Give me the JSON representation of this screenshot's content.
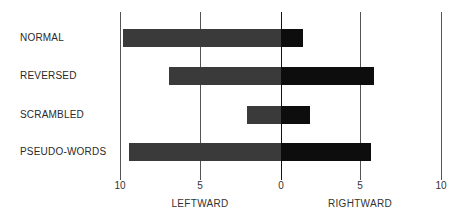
{
  "chart_data": {
    "type": "bar",
    "orientation": "horizontal-diverging",
    "title": "",
    "categories": [
      "NORMAL",
      "REVERSED",
      "SCRAMBLED",
      "PSEUDO-WORDS"
    ],
    "series": [
      {
        "name": "LEFTWARD",
        "values": [
          9.9,
          7.0,
          2.1,
          9.5
        ],
        "color": "#3a3a3a"
      },
      {
        "name": "RIGHTWARD",
        "values": [
          1.4,
          5.8,
          1.8,
          5.6
        ],
        "color": "#0d0d0d"
      }
    ],
    "xlabel_left": "LEFTWARD",
    "xlabel_right": "RIGHTWARD",
    "xticks": [
      "10",
      "5",
      "0",
      "5",
      "10"
    ],
    "xlim": [
      -10,
      10
    ],
    "grid": true,
    "legend": "none"
  },
  "labels": {
    "rows": [
      "NORMAL",
      "REVERSED",
      "SCRAMBLED",
      "PSEUDO-WORDS"
    ],
    "ticks": [
      "10",
      "5",
      "0",
      "5",
      "10"
    ],
    "axis_left": "LEFTWARD",
    "axis_right": "RIGHTWARD"
  }
}
